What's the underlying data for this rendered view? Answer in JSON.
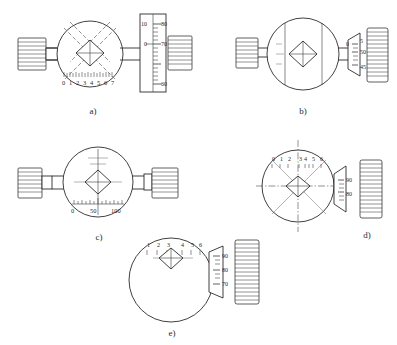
{
  "figure": {
    "background_color": "#ffffff",
    "line_color": "#2b2b2b"
  },
  "panels": [
    {
      "id": "a",
      "caption": "a)",
      "body_shape": "circle",
      "reticle": "diamond-with-cross",
      "graticule_lines": "diagonal-dashed-cross",
      "scale": {
        "position": "bottom",
        "orientation": "horizontal",
        "labels": [
          "0",
          "1",
          "2",
          "3",
          "4",
          "5",
          "6",
          "7"
        ],
        "minor_ticks": 32
      },
      "side_ruler": {
        "present": true,
        "orientation": "vertical",
        "left_labels": [
          "10",
          "0"
        ],
        "right_labels": [
          "80",
          "70",
          "60"
        ],
        "minor_ticks": 28
      },
      "knobs": [
        {
          "side": "left",
          "type": "knurled",
          "flutes": 9
        },
        {
          "side": "right",
          "type": "knurled",
          "flutes": 9
        }
      ]
    },
    {
      "id": "b",
      "caption": "b)",
      "body_shape": "circle",
      "reticle": "diamond-with-cross",
      "graticule_lines": "two-vertical-lines",
      "scale": {
        "position": "right-drum",
        "orientation": "vertical",
        "index_labels": [
          "0"
        ],
        "drum_labels": [
          "5",
          "50",
          "45"
        ],
        "minor_ticks": 14
      },
      "knobs": [
        {
          "side": "left",
          "type": "knurled",
          "flutes": 9
        },
        {
          "side": "right",
          "type": "knurled-drum",
          "flutes": 14
        }
      ]
    },
    {
      "id": "c",
      "caption": "c)",
      "body_shape": "circle",
      "reticle": "diamond-with-cross",
      "graticule_lines": "vertical-crosshair",
      "scale": {
        "position": "bottom",
        "orientation": "horizontal",
        "labels": [
          "0",
          "50",
          "100"
        ],
        "minor_ticks": 26
      },
      "knobs": [
        {
          "side": "left",
          "type": "knurled",
          "flutes": 9
        },
        {
          "side": "right",
          "type": "knurled",
          "flutes": 9
        }
      ]
    },
    {
      "id": "d",
      "caption": "d)",
      "body_shape": "circle",
      "reticle": "diamond-with-cross",
      "graticule_lines": "dashdot-cross-and-diagonals",
      "scale": {
        "position": "top",
        "orientation": "horizontal",
        "labels": [
          "0",
          "1",
          "2",
          "3",
          "4",
          "5",
          "6"
        ],
        "minor_ticks": 14
      },
      "side_drum": {
        "present": true,
        "labels": [
          "90",
          "80"
        ],
        "minor_ticks": 12
      },
      "knobs": [
        {
          "side": "right",
          "type": "knurled-drum",
          "flutes": 13
        }
      ]
    },
    {
      "id": "e",
      "caption": "e)",
      "body_shape": "circle",
      "reticle": "diamond-with-cross",
      "graticule_lines": "horizontal-centerline",
      "scale": {
        "position": "top",
        "orientation": "horizontal",
        "labels": [
          "1",
          "2",
          "3",
          "4",
          "5",
          "6"
        ],
        "minor_ticks": 12
      },
      "side_drum": {
        "present": true,
        "labels": [
          "90",
          "80",
          "70"
        ],
        "minor_ticks": 16
      },
      "knobs": [
        {
          "side": "right",
          "type": "knurled-drum",
          "flutes": 15
        }
      ]
    }
  ]
}
